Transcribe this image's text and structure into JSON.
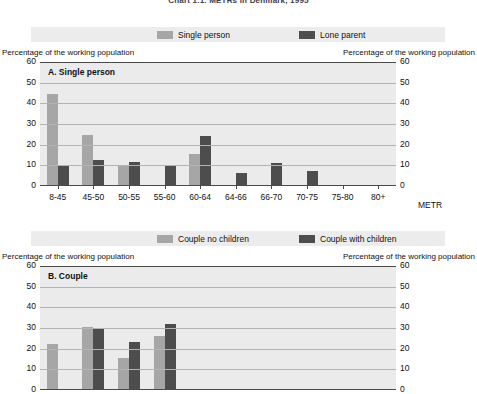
{
  "figure": {
    "title": "Chart 1.1.  METRs in Denmark, 1995"
  },
  "axis_caption": {
    "left": "Percentage of the working population",
    "right": "Percentage of the working population"
  },
  "panel_a": {
    "label": "A.  Single person",
    "legend": [
      {
        "name": "legend-single-person",
        "label": "Single person",
        "color": "#a6a6a6"
      },
      {
        "name": "legend-lone-parent",
        "label": "Lone parent",
        "color": "#4d4d4d"
      }
    ],
    "x_unit": "METR"
  },
  "panel_b": {
    "label": "B.  Couple",
    "legend": [
      {
        "name": "legend-couple-no-children",
        "label": "Couple no children",
        "color": "#a6a6a6"
      },
      {
        "name": "legend-couple-with-children",
        "label": "Couple with children",
        "color": "#4d4d4d"
      }
    ],
    "x_unit": "METR"
  },
  "chart_data": [
    {
      "type": "bar",
      "id": "panel-a",
      "title": "A.  Single person",
      "xlabel": "METR",
      "ylabel": "Percentage of the working population",
      "ylim": [
        0,
        60
      ],
      "yticks": [
        0,
        10,
        20,
        30,
        40,
        50,
        60
      ],
      "grid": true,
      "legend_position": "top",
      "categories": [
        "8-45",
        "45-50",
        "50-55",
        "55-60",
        "60-64",
        "64-66",
        "66-70",
        "70-75",
        "75-80",
        "80+"
      ],
      "series": [
        {
          "name": "Single person",
          "color": "#a6a6a6",
          "values": [
            44.5,
            24.5,
            9.5,
            0.7,
            15.5,
            0,
            0,
            0,
            0,
            0
          ]
        },
        {
          "name": "Lone parent",
          "color": "#4d4d4d",
          "values": [
            9.5,
            12.5,
            11.5,
            9.5,
            24.0,
            6.5,
            11.0,
            7.5,
            0.5,
            0.3
          ]
        }
      ]
    },
    {
      "type": "bar",
      "id": "panel-b",
      "title": "B.  Couple",
      "xlabel": "METR",
      "ylabel": "Percentage of the working population",
      "ylim": [
        0,
        60
      ],
      "yticks": [
        0,
        10,
        20,
        30,
        40,
        50,
        60
      ],
      "grid": true,
      "legend_position": "top",
      "categories": [
        "8-45",
        "45-50",
        "50-55",
        "55-60",
        "60-64",
        "64-66",
        "66-70",
        "70-75",
        "75-80",
        "80+"
      ],
      "note": "Panel B is cropped by the bottom edge of the screenshot; only the upper part of the plot is visible.",
      "series": [
        {
          "name": "Couple no children",
          "color": "#a6a6a6",
          "values": [
            22.5,
            30.5,
            15.5,
            26.0,
            null,
            null,
            null,
            null,
            null,
            null
          ]
        },
        {
          "name": "Couple with children",
          "color": "#4d4d4d",
          "values": [
            0,
            29.5,
            23.0,
            32.0,
            null,
            null,
            null,
            null,
            null,
            null
          ]
        }
      ]
    }
  ]
}
